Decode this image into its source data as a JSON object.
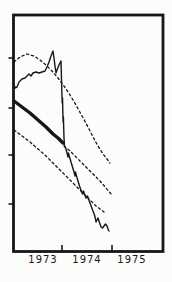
{
  "figure": {
    "background": "#fcfcfa",
    "ink": "#171717",
    "kind": "scanned statistical figure, time-series forecast with confidence bands"
  },
  "chart_data": {
    "type": "line",
    "title": "",
    "xlabel": "",
    "ylabel": "",
    "grid": "off",
    "legend": null,
    "x_axis": {
      "tick_labels": [
        "1973",
        "1974",
        "1975"
      ],
      "tick_label_px": [
        43,
        87,
        132
      ],
      "boundary_tick_px": [
        62,
        112
      ],
      "mapping_note": "boundary ticks mark year starts: x=62px is 1974.0, x=112px is 1975.0 (50px per year); year labels centered mid-year",
      "ticks_point": "inside"
    },
    "y_axis": {
      "tick_labels": [],
      "tick_px": [
        58,
        108,
        155,
        204
      ],
      "mapping_note": "no numeric scale printed; four unlabeled ticks on left axis",
      "ticks_point": "outside"
    },
    "frame_px": {
      "left": 13.5,
      "top": 15,
      "right": 163,
      "bottom": 251.5
    },
    "series": [
      {
        "name": "observed-series",
        "style": "thin-solid",
        "stroke_width": 1.4,
        "dash": null,
        "points_px": [
          [
            14,
            84
          ],
          [
            15,
            88
          ],
          [
            17,
            87
          ],
          [
            19,
            82
          ],
          [
            22,
            79
          ],
          [
            25,
            78
          ],
          [
            27,
            76
          ],
          [
            29,
            74
          ],
          [
            31,
            76
          ],
          [
            33,
            73
          ],
          [
            36,
            72
          ],
          [
            39,
            73
          ],
          [
            42,
            72
          ],
          [
            45,
            71
          ],
          [
            47,
            67
          ],
          [
            49,
            62
          ],
          [
            51,
            56
          ],
          [
            53,
            51
          ],
          [
            54,
            58
          ],
          [
            55,
            66
          ],
          [
            56,
            73
          ],
          [
            57,
            70
          ],
          [
            59,
            65
          ],
          [
            61,
            61
          ],
          [
            61.4,
            75
          ],
          [
            61.8,
            90
          ],
          [
            62.2,
            103
          ],
          [
            62.5,
            98
          ],
          [
            62.8,
            110
          ],
          [
            63.1,
            122
          ],
          [
            63.4,
            117
          ],
          [
            63.7,
            128
          ],
          [
            64,
            138
          ],
          [
            64.5,
            146
          ],
          [
            66,
            149
          ],
          [
            67,
            153
          ],
          [
            68,
            157
          ],
          [
            68.5,
            153
          ],
          [
            69.5,
            157
          ],
          [
            71,
            162
          ],
          [
            72.5,
            167
          ],
          [
            74,
            172
          ],
          [
            75,
            176
          ],
          [
            75.5,
            172
          ],
          [
            76.5,
            176
          ],
          [
            78,
            181
          ],
          [
            79.5,
            186
          ],
          [
            81,
            190
          ],
          [
            82.5,
            194
          ],
          [
            83.5,
            191
          ],
          [
            84.5,
            194
          ],
          [
            86,
            198
          ],
          [
            87.5,
            196
          ],
          [
            88.5,
            199
          ],
          [
            90,
            203
          ],
          [
            91.5,
            207
          ],
          [
            93,
            211
          ],
          [
            94.5,
            215
          ],
          [
            95.5,
            219
          ],
          [
            96,
            222
          ],
          [
            97,
            220
          ],
          [
            98,
            218
          ],
          [
            99,
            221
          ],
          [
            100,
            224
          ],
          [
            101,
            227
          ],
          [
            102.5,
            228
          ],
          [
            104,
            226
          ],
          [
            105.5,
            224
          ],
          [
            107,
            226
          ],
          [
            108,
            229
          ],
          [
            109,
            231
          ]
        ]
      },
      {
        "name": "trend-line",
        "style": "thick-solid",
        "stroke_width": 3.4,
        "dash": null,
        "points_px": [
          [
            14,
            101
          ],
          [
            22,
            107
          ],
          [
            30,
            113
          ],
          [
            38,
            120
          ],
          [
            46,
            127
          ],
          [
            53,
            134
          ],
          [
            58,
            138
          ],
          [
            63,
            143
          ]
        ]
      },
      {
        "name": "forecast-line",
        "style": "dashed",
        "stroke_width": 1.3,
        "dash": "2.2 2.8",
        "points_px": [
          [
            64,
            146
          ],
          [
            70,
            151
          ],
          [
            76,
            157
          ],
          [
            82,
            163
          ],
          [
            88,
            169
          ],
          [
            94,
            175
          ],
          [
            100,
            181
          ],
          [
            106,
            188
          ],
          [
            112,
            195
          ]
        ]
      },
      {
        "name": "upper-confidence-band",
        "style": "dashed",
        "stroke_width": 1.3,
        "dash": "2.2 2.8",
        "points_px": [
          [
            14,
            62
          ],
          [
            20,
            57
          ],
          [
            27,
            54
          ],
          [
            34,
            56
          ],
          [
            40,
            60
          ],
          [
            46,
            65
          ],
          [
            52,
            71
          ],
          [
            58,
            78
          ],
          [
            64,
            86
          ],
          [
            70,
            95
          ],
          [
            76,
            105
          ],
          [
            82,
            116
          ],
          [
            88,
            127
          ],
          [
            93,
            137
          ],
          [
            98,
            146
          ],
          [
            103,
            154
          ],
          [
            107,
            159
          ],
          [
            110,
            163
          ]
        ]
      },
      {
        "name": "lower-confidence-band",
        "style": "dashed",
        "stroke_width": 1.3,
        "dash": "2.2 2.8",
        "points_px": [
          [
            14,
            130
          ],
          [
            22,
            136
          ],
          [
            30,
            142
          ],
          [
            38,
            149
          ],
          [
            46,
            156
          ],
          [
            54,
            164
          ],
          [
            62,
            172
          ],
          [
            70,
            180
          ],
          [
            78,
            188
          ],
          [
            85,
            195
          ],
          [
            91,
            201
          ],
          [
            96,
            206
          ],
          [
            100,
            209
          ],
          [
            104,
            212
          ]
        ]
      }
    ]
  }
}
